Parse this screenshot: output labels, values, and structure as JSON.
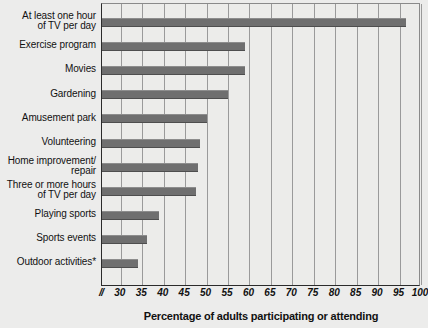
{
  "chart_data": {
    "type": "bar",
    "orientation": "horizontal",
    "title": "",
    "xlabel": "Percentage of adults participating or attending",
    "ylabel": "",
    "xlim": [
      25.6,
      100
    ],
    "axis_break": "//",
    "grid": true,
    "legend": null,
    "xticks": [
      30,
      35,
      40,
      45,
      50,
      55,
      60,
      65,
      70,
      75,
      80,
      85,
      90,
      95,
      100
    ],
    "categories": [
      "At least one hour\nof TV per day",
      "Exercise program",
      "Movies",
      "Gardening",
      "Amusement park",
      "Volunteering",
      "Home improvement/\nrepair",
      "Three or more hours\nof TV per day",
      "Playing sports",
      "Sports events",
      "Outdoor activities*"
    ],
    "values": [
      96.5,
      59,
      59,
      55,
      50,
      48.5,
      48,
      47.5,
      39,
      36,
      34
    ],
    "footnote": "*",
    "colors": {
      "bar": "#6f6f6f",
      "plot_background": "#ececea",
      "page_background": "#ececeb",
      "gridline": "#9a9a9a",
      "axis": "#2b2b2b",
      "text": "#111111"
    }
  }
}
